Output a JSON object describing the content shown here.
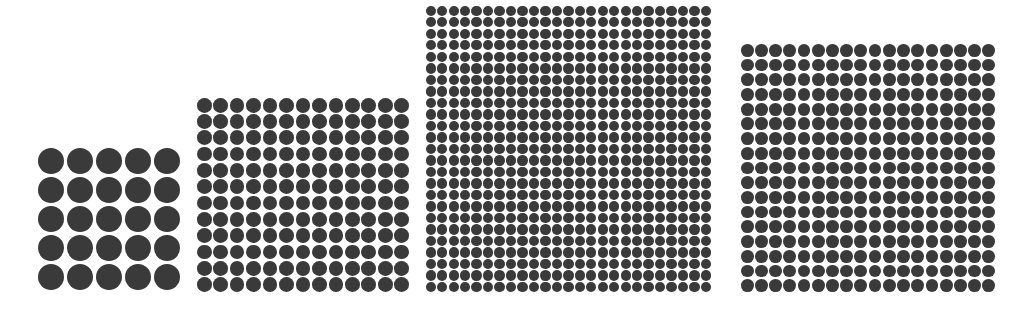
{
  "figure": {
    "title": "",
    "dot_color": "#3a3a3a",
    "background": "#ffffff",
    "grids": [
      {
        "label": "grid-1",
        "cols": 5,
        "rows": 5,
        "count": 25,
        "left": 37,
        "top": 147,
        "width": 144,
        "height": 144
      },
      {
        "label": "grid-2",
        "cols": 13,
        "rows": 12,
        "count": 156,
        "left": 196,
        "top": 97,
        "width": 214,
        "height": 196
      },
      {
        "label": "grid-3",
        "cols": 25,
        "rows": 25,
        "count": 625,
        "left": 425,
        "top": 5,
        "width": 287,
        "height": 288
      },
      {
        "label": "grid-4",
        "cols": 18,
        "rows": 17,
        "count": 306,
        "left": 740,
        "top": 43,
        "width": 256,
        "height": 250
      }
    ]
  }
}
